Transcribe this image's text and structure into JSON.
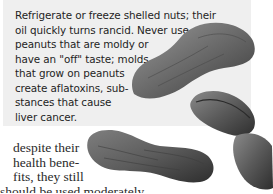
{
  "sidebar_box": {
    "lines": [
      "Refrigerate or freeze shelled nuts; their",
      "oil quickly turns rancid. Never use",
      "peanuts that are moldy or",
      "have an \"off\" taste; molds",
      "that grow on peanuts",
      "create aflatoxins, sub-",
      "stances that cause",
      "liver cancer."
    ]
  },
  "body": {
    "lines": [
      "despite their",
      "health bene-",
      "fits, they still",
      "should be used moderately."
    ]
  },
  "images": [
    {
      "name": "peanut-in-shell-top",
      "alt": "peanut in shell"
    },
    {
      "name": "peanut-in-shell-bottom",
      "alt": "peanut in shell"
    },
    {
      "name": "shelled-peanut-halves",
      "alt": "shelled peanut kernels"
    }
  ],
  "colors": {
    "box_bg": "#efefef",
    "text": "#1e1e1e"
  }
}
